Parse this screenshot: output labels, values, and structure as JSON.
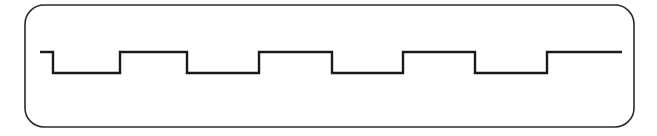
{
  "figure": {
    "title": "Square wave timing diagram",
    "background_color": "#ffffff",
    "canvas": {
      "width": 657,
      "height": 136
    }
  },
  "panel": {
    "name": "rounded-rectangle-frame",
    "x": 25,
    "y": 5,
    "width": 609,
    "height": 122,
    "corner_radius": 19,
    "stroke_color": "#2b2b2b",
    "stroke_width": 1.6,
    "fill_color": "#ffffff"
  },
  "waveform": {
    "name": "square-wave",
    "stroke_color": "#1a1a1a",
    "stroke_width": 2.4,
    "high_level_y": 52,
    "low_level_y": 73,
    "start_x": 40,
    "end_x": 622,
    "period_px": 142,
    "duty_cycle_percent": 50,
    "cycles_visible": 4.5,
    "initial_state": "high",
    "final_state": "high",
    "transitions": [
      {
        "x": 53,
        "edge": "falling"
      },
      {
        "x": 120,
        "edge": "rising"
      },
      {
        "x": 187,
        "edge": "falling"
      },
      {
        "x": 259,
        "edge": "rising"
      },
      {
        "x": 332,
        "edge": "falling"
      },
      {
        "x": 403,
        "edge": "rising"
      },
      {
        "x": 475,
        "edge": "falling"
      },
      {
        "x": 547,
        "edge": "rising"
      }
    ],
    "path_d": "M 40 52 L 53 52 L 53 73 L 120 73 L 120 52 L 187 52 L 187 73 L 259 73 L 259 52 L 332 52 L 332 73 L 403 73 L 403 52 L 475 52 L 475 73 L 547 73 L 547 52 L 622 52"
  },
  "chart_data": {
    "type": "line",
    "title": "Square wave timing diagram",
    "xlabel": "",
    "ylabel": "",
    "grid": false,
    "legend": "none",
    "series": [
      {
        "name": "digital-signal",
        "x": [
          40,
          53,
          53,
          120,
          120,
          187,
          187,
          259,
          259,
          332,
          332,
          403,
          403,
          475,
          475,
          547,
          547,
          622
        ],
        "values": [
          1,
          1,
          0,
          0,
          1,
          1,
          0,
          0,
          1,
          1,
          0,
          0,
          1,
          1,
          0,
          0,
          1,
          1
        ]
      }
    ],
    "ylim": [
      0,
      1
    ],
    "xlim": [
      25,
      634
    ],
    "tick_labels_x": [],
    "tick_labels_y": []
  }
}
